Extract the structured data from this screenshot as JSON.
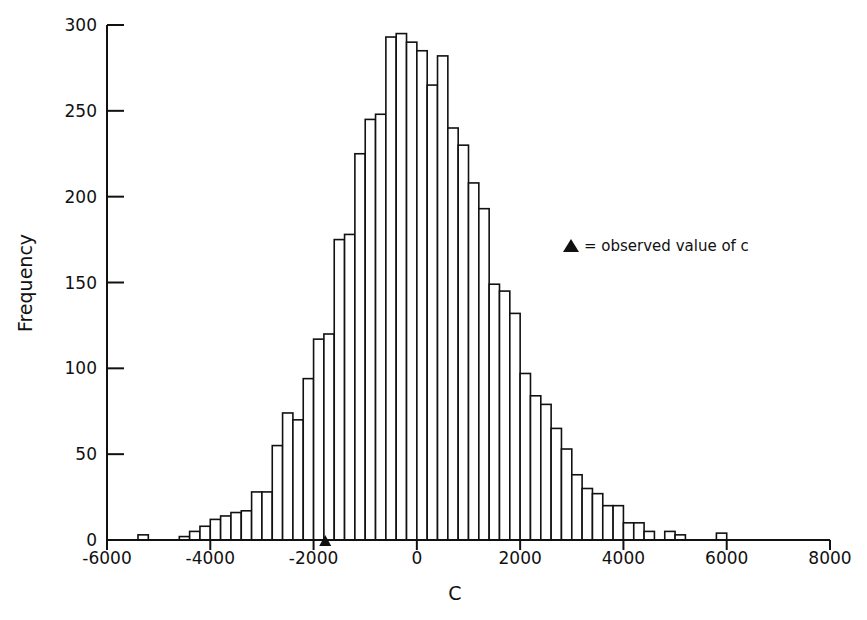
{
  "chart_data": {
    "type": "bar",
    "subtype": "histogram",
    "title": "",
    "xlabel": "C",
    "ylabel": "Frequency",
    "xlim": [
      -6000,
      8000
    ],
    "ylim": [
      0,
      300
    ],
    "xticks": [
      -6000,
      -4000,
      -2000,
      0,
      2000,
      4000,
      6000,
      8000
    ],
    "xtick_labels": [
      "-6000",
      "-4000",
      "-2000",
      "0",
      "2000",
      "4000",
      "6000",
      "8000"
    ],
    "yticks": [
      0,
      50,
      100,
      150,
      200,
      250,
      300
    ],
    "ytick_labels": [
      "0",
      "50",
      "100",
      "150",
      "200",
      "250",
      "300"
    ],
    "bin_width": 200,
    "bins": [
      {
        "x": -5400,
        "count": 3
      },
      {
        "x": -4600,
        "count": 2
      },
      {
        "x": -4400,
        "count": 5
      },
      {
        "x": -4200,
        "count": 8
      },
      {
        "x": -4000,
        "count": 12
      },
      {
        "x": -3800,
        "count": 14
      },
      {
        "x": -3600,
        "count": 16
      },
      {
        "x": -3400,
        "count": 17
      },
      {
        "x": -3200,
        "count": 28
      },
      {
        "x": -3000,
        "count": 28
      },
      {
        "x": -2800,
        "count": 55
      },
      {
        "x": -2600,
        "count": 74
      },
      {
        "x": -2400,
        "count": 70
      },
      {
        "x": -2200,
        "count": 94
      },
      {
        "x": -2000,
        "count": 117
      },
      {
        "x": -1800,
        "count": 120
      },
      {
        "x": -1600,
        "count": 175
      },
      {
        "x": -1400,
        "count": 178
      },
      {
        "x": -1200,
        "count": 225
      },
      {
        "x": -1000,
        "count": 245
      },
      {
        "x": -800,
        "count": 248
      },
      {
        "x": -600,
        "count": 293
      },
      {
        "x": -400,
        "count": 295
      },
      {
        "x": -200,
        "count": 290
      },
      {
        "x": 0,
        "count": 285
      },
      {
        "x": 200,
        "count": 265
      },
      {
        "x": 400,
        "count": 282
      },
      {
        "x": 600,
        "count": 240
      },
      {
        "x": 800,
        "count": 230
      },
      {
        "x": 1000,
        "count": 208
      },
      {
        "x": 1200,
        "count": 193
      },
      {
        "x": 1400,
        "count": 149
      },
      {
        "x": 1600,
        "count": 145
      },
      {
        "x": 1800,
        "count": 132
      },
      {
        "x": 2000,
        "count": 97
      },
      {
        "x": 2200,
        "count": 84
      },
      {
        "x": 2400,
        "count": 79
      },
      {
        "x": 2600,
        "count": 65
      },
      {
        "x": 2800,
        "count": 53
      },
      {
        "x": 3000,
        "count": 38
      },
      {
        "x": 3200,
        "count": 30
      },
      {
        "x": 3400,
        "count": 27
      },
      {
        "x": 3600,
        "count": 20
      },
      {
        "x": 3800,
        "count": 20
      },
      {
        "x": 4000,
        "count": 10
      },
      {
        "x": 4200,
        "count": 10
      },
      {
        "x": 4400,
        "count": 5
      },
      {
        "x": 4800,
        "count": 5
      },
      {
        "x": 5000,
        "count": 3
      },
      {
        "x": 5800,
        "count": 4
      }
    ],
    "annotation": {
      "marker": "filled-triangle",
      "x": -1600,
      "label": "= observed value of c"
    },
    "grid": false,
    "legend_position": "right-middle"
  },
  "legend": {
    "text": "= observed value of c"
  }
}
